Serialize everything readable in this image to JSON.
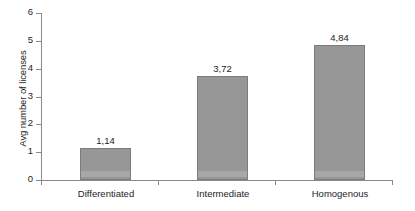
{
  "chart_data": {
    "type": "bar",
    "title": "",
    "subtitle": "",
    "xlabel": "",
    "ylabel": "Avg number of licenses",
    "categories": [
      "Differentiated",
      "Intermediate",
      "Homogenous"
    ],
    "values": [
      1.14,
      3.72,
      4.84
    ],
    "value_labels": [
      "1,14",
      "3,72",
      "4,84"
    ],
    "decimal_separator": ",",
    "ylim": [
      0,
      6
    ],
    "ytick_values": [
      0,
      1,
      2,
      3,
      4,
      5,
      6
    ],
    "ytick_labels": [
      "0",
      "1",
      "2",
      "3",
      "4",
      "5",
      "6"
    ],
    "grid": false,
    "legend": false,
    "legend_position": "none",
    "series": [
      {
        "name": "Avg number of licenses",
        "values": [
          1.14,
          3.72,
          4.84
        ]
      }
    ],
    "colors": {
      "bar_fill": "#979797",
      "bar_border": "#7c7c7c",
      "axis": "#8a8a8a",
      "text": "#1d1d1d",
      "background": "#ffffff"
    }
  }
}
